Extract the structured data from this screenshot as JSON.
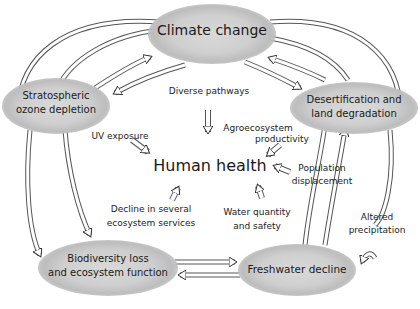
{
  "diagram": {
    "center": {
      "label": "Human health"
    },
    "nodes": [
      {
        "id": "climate",
        "label": "Climate change"
      },
      {
        "id": "ozone",
        "label_line1": "Stratospheric",
        "label_line2": "ozone depletion"
      },
      {
        "id": "desert",
        "label_line1": "Desertification and",
        "label_line2": "land degradation"
      },
      {
        "id": "biodiversity",
        "label_line1": "Biodiversity loss",
        "label_line2": "and ecosystem function"
      },
      {
        "id": "freshwater",
        "label": "Freshwater decline"
      }
    ],
    "edge_labels": {
      "diverse_pathways": "Diverse pathways",
      "uv_exposure": "UV exposure",
      "agro_line1": "Agroecosystem",
      "agro_line2": "productivity",
      "pop_line1": "Population",
      "pop_line2": "displacement",
      "decline_line1": "Decline in several",
      "decline_line2": "ecosystem services",
      "water_line1": "Water quantity",
      "water_line2": "and safety",
      "altered_line1": "Altered",
      "altered_line2": "precipitation"
    },
    "colors": {
      "blob": "#cfcfcf",
      "stroke": "#333333",
      "text": "#1a1a1a"
    }
  }
}
